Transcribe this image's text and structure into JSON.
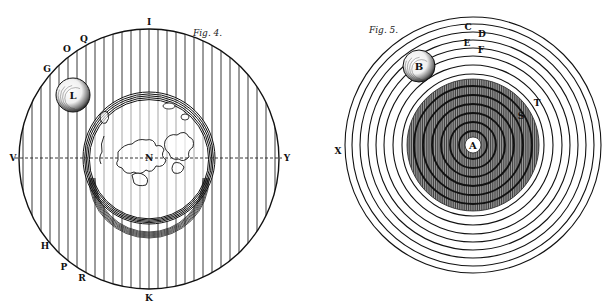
{
  "figures": [
    {
      "id": "fig4",
      "caption": "Fig. 4.",
      "outer_circle": {
        "cx": 149,
        "cy": 159,
        "r": 130
      },
      "globe": {
        "cx": 149,
        "cy": 158,
        "r": 66,
        "label": "N"
      },
      "moon": {
        "cx": 73,
        "cy": 95,
        "r": 17,
        "label": "L"
      },
      "axis_line": {
        "left_label": "V",
        "right_label": "Y"
      },
      "point_labels": [
        {
          "text": "I",
          "x": 149,
          "y": 25
        },
        {
          "text": "Q",
          "x": 84,
          "y": 42
        },
        {
          "text": "O",
          "x": 67,
          "y": 52
        },
        {
          "text": "G",
          "x": 47,
          "y": 72
        },
        {
          "text": "H",
          "x": 45,
          "y": 249
        },
        {
          "text": "P",
          "x": 64,
          "y": 270
        },
        {
          "text": "R",
          "x": 82,
          "y": 281
        },
        {
          "text": "K",
          "x": 149,
          "y": 301
        }
      ]
    },
    {
      "id": "fig5",
      "caption": "Fig. 5.",
      "center": {
        "cx": 473,
        "cy": 145,
        "label": "A"
      },
      "outer_rings_radii": [
        71,
        80,
        89,
        97,
        105,
        113,
        121,
        128
      ],
      "disc": {
        "r": 66
      },
      "inner_rings_radii": [
        14,
        23,
        32,
        41,
        50,
        59
      ],
      "moon": {
        "cx": 419,
        "cy": 66,
        "r": 16,
        "label": "B"
      },
      "point_labels": [
        {
          "text": "C",
          "x": 468,
          "y": 30
        },
        {
          "text": "D",
          "x": 482,
          "y": 37
        },
        {
          "text": "E",
          "x": 467,
          "y": 46
        },
        {
          "text": "F",
          "x": 481,
          "y": 53
        },
        {
          "text": "T",
          "x": 537,
          "y": 106
        },
        {
          "text": "S",
          "x": 521,
          "y": 119
        },
        {
          "text": "X",
          "x": 338,
          "y": 154
        }
      ]
    }
  ]
}
